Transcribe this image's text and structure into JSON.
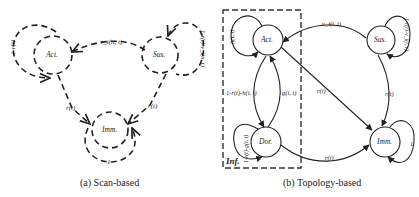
{
  "panel_a": {
    "caption": "(a) Scan-based",
    "nodes": {
      "act": "Act.",
      "sus": "Sus.",
      "imm": "Imm."
    },
    "edges": {
      "act_self": "1-r(t)",
      "sus_to_act": "v_i(n, t)",
      "sus_self": "1-r(t)-v_i(n, t)",
      "act_to_imm": "r(t)",
      "sus_to_imm": "r(t)",
      "imm_self": "1"
    }
  },
  "panel_b": {
    "caption": "(b) Topology-based",
    "group_label": "Inf.",
    "nodes": {
      "act": "Act.",
      "sus": "Sus.",
      "dor": "Dor.",
      "imm": "Imm."
    },
    "edges": {
      "act_self": "h(i, t)",
      "sus_to_act": "v_i(i, t)",
      "sus_self": "1-r(t)-v_i(i, t)",
      "act_to_dor": "1-r(t)-h(i, t)",
      "dor_to_act": "g(i, t)",
      "dor_self": "1-r(t)-g(i, t)",
      "act_to_imm": "r(t)",
      "sus_to_imm": "r(t)",
      "dor_to_imm": "r(t)",
      "imm_self": "1"
    }
  }
}
